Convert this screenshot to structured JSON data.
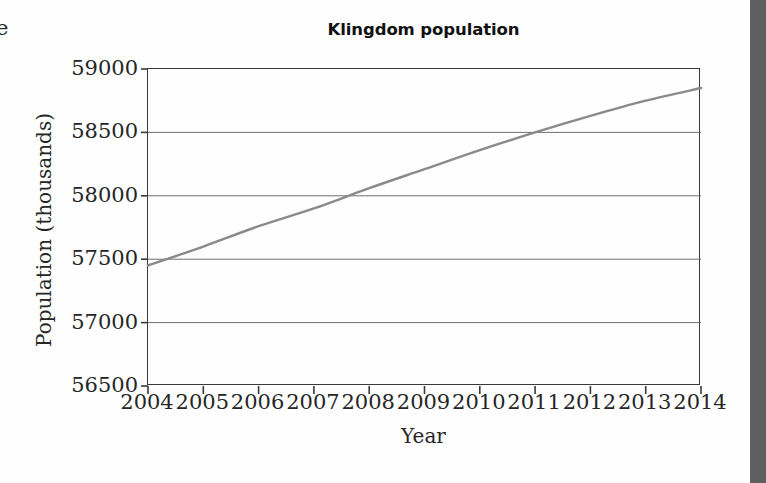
{
  "chart_data": {
    "type": "line",
    "title": "Klingdom population",
    "xlabel": "Year",
    "ylabel": "Population (thousands)",
    "grid": "horizontal",
    "legend": "none",
    "xlim": [
      2004,
      2014
    ],
    "ylim": [
      56500,
      59000
    ],
    "x_ticks": [
      "2004",
      "2005",
      "2006",
      "2007",
      "2008",
      "2009",
      "2010",
      "2011",
      "2012",
      "2013",
      "2014"
    ],
    "y_ticks": [
      "56500",
      "57000",
      "57500",
      "58000",
      "58500",
      "59000"
    ],
    "line_color": "#8a8a8a",
    "x": [
      2004,
      2005,
      2006,
      2007,
      2008,
      2009,
      2010,
      2011,
      2012,
      2013,
      2014
    ],
    "series": [
      {
        "name": "Klingdom population",
        "values": [
          57450,
          57600,
          57760,
          57900,
          58060,
          58210,
          58360,
          58500,
          58630,
          58750,
          58850
        ]
      }
    ]
  },
  "figure": {
    "title": "Klingdom population",
    "x_axis_title": "Year",
    "y_axis_title": "Population (thousands)"
  },
  "artifacts": {
    "left_edge_glyph": "e"
  }
}
